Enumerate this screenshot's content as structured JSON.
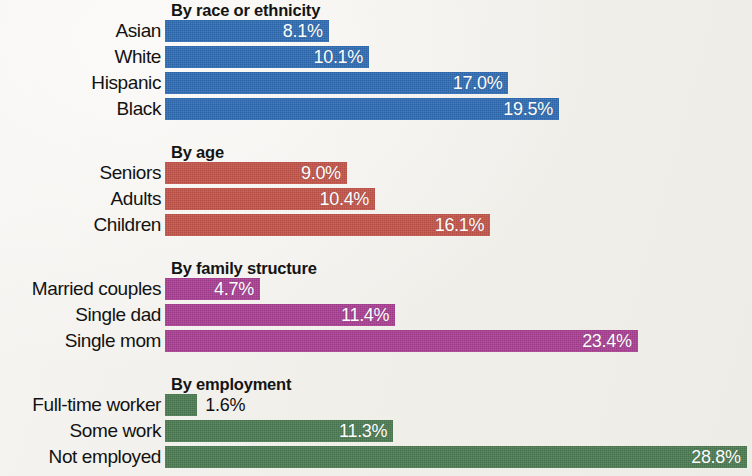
{
  "chart_data": {
    "type": "bar",
    "orientation": "horizontal",
    "title": "",
    "subtitle": "",
    "xlabel": "",
    "ylabel": "",
    "xlim": [
      0,
      28.8
    ],
    "grid": false,
    "legend": "none",
    "value_suffix": "%",
    "groups": [
      {
        "heading": "By race or ethnicity",
        "color": "#2f6cb3",
        "categories": [
          "Asian",
          "White",
          "Hispanic",
          "Black"
        ],
        "values": [
          8.1,
          10.1,
          17.0,
          19.5
        ],
        "value_labels": [
          "8.1%",
          "10.1%",
          "17.0%",
          "19.5%"
        ],
        "label_position": [
          "inside",
          "inside",
          "inside",
          "inside"
        ]
      },
      {
        "heading": "By age",
        "color": "#c2544a",
        "categories": [
          "Seniors",
          "Adults",
          "Children"
        ],
        "values": [
          9.0,
          10.4,
          16.1
        ],
        "value_labels": [
          "9.0%",
          "10.4%",
          "16.1%"
        ],
        "label_position": [
          "inside",
          "inside",
          "inside"
        ]
      },
      {
        "heading": "By family structure",
        "color": "#a83f93",
        "categories": [
          "Married couples",
          "Single dad",
          "Single mom"
        ],
        "values": [
          4.7,
          11.4,
          23.4
        ],
        "value_labels": [
          "4.7%",
          "11.4%",
          "23.4%"
        ],
        "label_position": [
          "inside",
          "inside",
          "inside"
        ]
      },
      {
        "heading": "By employment",
        "color": "#4c7b52",
        "categories": [
          "Full-time worker",
          "Some work",
          "Not employed"
        ],
        "values": [
          1.6,
          11.3,
          28.8
        ],
        "value_labels": [
          "1.6%",
          "11.3%",
          "28.8%"
        ],
        "label_position": [
          "outside",
          "inside",
          "inside"
        ]
      }
    ]
  },
  "layout": {
    "label_column_width_px": 165,
    "bar_origin_x_px": 169,
    "pixels_per_percent": 20.2,
    "bar_height_px": 22,
    "row_pitch_px": 26,
    "background_color": "#f3f1ed"
  }
}
